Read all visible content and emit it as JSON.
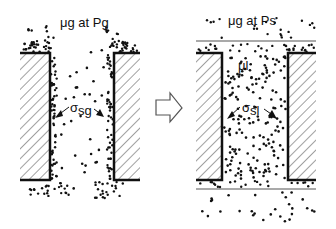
{
  "diagram": {
    "left_panel": {
      "top_label": "μg at Pg",
      "interface_label_sigma": "σ",
      "interface_label_sub": "sg",
      "state": "gas-filled pore, adsorbed film on walls"
    },
    "arrow": {
      "direction": "right",
      "shape": "outlined block arrow"
    },
    "right_panel": {
      "top_label": "μg at Ps",
      "interior_label": "μl",
      "interface_label_sigma": "σ",
      "interface_label_sub": "sl",
      "state": "liquid-filled pore with meniscus lines above and below"
    },
    "colors": {
      "ink": "#111111",
      "hatch": "#444444",
      "background": "#ffffff",
      "meniscus": "#555555"
    }
  }
}
